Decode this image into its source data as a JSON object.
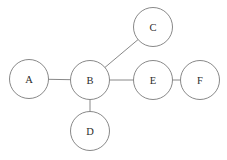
{
  "diagram": {
    "background_color": "#ffffff",
    "stroke_color": "#7a7a7a",
    "label_color": "#2b2b2b",
    "node_fill": "#ffffff",
    "node_radius": 19.5,
    "nodes": [
      {
        "id": "A",
        "label": "A",
        "cx": 29,
        "cy": 79,
        "r": 19.5
      },
      {
        "id": "B",
        "label": "B",
        "cx": 90,
        "cy": 80,
        "r": 19.5
      },
      {
        "id": "C",
        "label": "C",
        "cx": 153,
        "cy": 27,
        "r": 19.5
      },
      {
        "id": "D",
        "label": "D",
        "cx": 90,
        "cy": 131,
        "r": 19.5
      },
      {
        "id": "E",
        "label": "E",
        "cx": 153,
        "cy": 80,
        "r": 19.5
      },
      {
        "id": "F",
        "label": "F",
        "cx": 200,
        "cy": 80,
        "r": 19.5
      }
    ],
    "edges": [
      {
        "id": "A-B",
        "source": "A",
        "target": "B"
      },
      {
        "id": "B-C",
        "source": "B",
        "target": "C"
      },
      {
        "id": "B-D",
        "source": "B",
        "target": "D"
      },
      {
        "id": "B-E",
        "source": "B",
        "target": "E"
      },
      {
        "id": "E-F",
        "source": "E",
        "target": "F"
      }
    ]
  }
}
